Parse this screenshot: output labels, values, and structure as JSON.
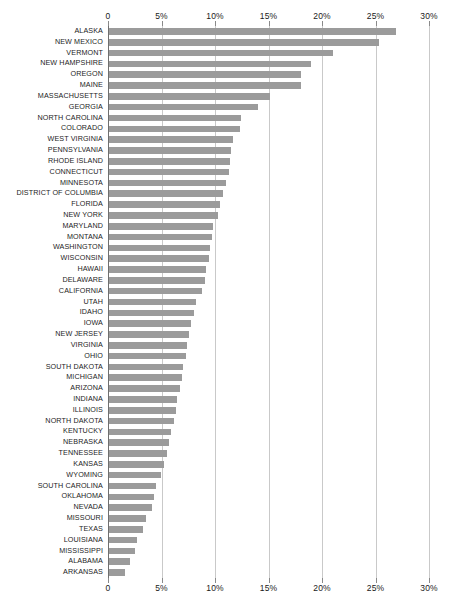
{
  "chart_data": {
    "type": "bar",
    "orientation": "horizontal",
    "title": "",
    "subtitle": "",
    "xlabel": "",
    "ylabel": "",
    "xlim": [
      0,
      30
    ],
    "ylim": null,
    "grid": true,
    "legend": null,
    "legend_position": "none",
    "xtick_labels": [
      "0",
      "5%",
      "10%",
      "15%",
      "20%",
      "25%",
      "30%"
    ],
    "xtick_values": [
      0,
      5,
      10,
      15,
      20,
      25,
      30
    ],
    "axis_top_labels": [
      "0",
      "5%",
      "10%",
      "15%",
      "20%",
      "25%",
      "30%"
    ],
    "axis_bottom_labels": [
      "0",
      "5%",
      "10%",
      "15%",
      "20%",
      "25%",
      "30%"
    ],
    "bar_color": "#9b9b9b",
    "gridline_color": "#c9c9c9",
    "background_color": "#ffffff",
    "unit": "%",
    "categories": [
      "ALASKA",
      "NEW MEXICO",
      "VERMONT",
      "NEW HAMPSHIRE",
      "OREGON",
      "MAINE",
      "MASSACHUSETTS",
      "GEORGIA",
      "NORTH CAROLINA",
      "COLORADO",
      "WEST VIRGINIA",
      "PENNSYLVANIA",
      "RHODE ISLAND",
      "CONNECTICUT",
      "MINNESOTA",
      "DISTRICT OF COLUMBIA",
      "FLORIDA",
      "NEW YORK",
      "MARYLAND",
      "MONTANA",
      "WASHINGTON",
      "WISCONSIN",
      "HAWAII",
      "DELAWARE",
      "CALIFORNIA",
      "UTAH",
      "IDAHO",
      "IOWA",
      "NEW JERSEY",
      "VIRGINIA",
      "OHIO",
      "SOUTH DAKOTA",
      "MICHIGAN",
      "ARIZONA",
      "INDIANA",
      "ILLINOIS",
      "NORTH DAKOTA",
      "KENTUCKY",
      "NEBRASKA",
      "TENNESSEE",
      "KANSAS",
      "WYOMING",
      "SOUTH CAROLINA",
      "OKLAHOMA",
      "NEVADA",
      "MISSOURI",
      "TEXAS",
      "LOUISIANA",
      "MISSISSIPPI",
      "ALABAMA",
      "ARKANSAS"
    ],
    "values": [
      26.8,
      25.2,
      20.9,
      18.9,
      17.9,
      17.9,
      15.0,
      13.9,
      12.3,
      12.2,
      11.6,
      11.4,
      11.3,
      11.2,
      10.9,
      10.7,
      10.4,
      10.2,
      9.7,
      9.6,
      9.4,
      9.3,
      9.1,
      9.0,
      8.7,
      8.1,
      7.9,
      7.7,
      7.5,
      7.3,
      7.2,
      6.9,
      6.8,
      6.6,
      6.4,
      6.3,
      6.1,
      5.8,
      5.6,
      5.4,
      5.1,
      4.9,
      4.4,
      4.2,
      4.0,
      3.5,
      3.2,
      2.6,
      2.4,
      2.0,
      1.5
    ]
  }
}
